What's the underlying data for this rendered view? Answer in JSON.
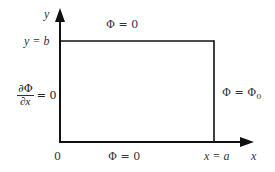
{
  "diagram": {
    "title": "",
    "axes": {
      "y_label": "y",
      "x_label": "x",
      "origin_label": "0",
      "y_top_label": "y = b",
      "x_right_label": "x = a"
    },
    "boundaries": {
      "top": "Φ = 0",
      "bottom": "Φ = 0",
      "right_main": "Φ = Φ",
      "right_sub": "0",
      "left_numerator": "∂Φ",
      "left_denominator": "∂x",
      "left_equals": "= 0"
    },
    "colors": {
      "line": "#111111",
      "text": "#333333",
      "background": "#ffffff"
    }
  }
}
